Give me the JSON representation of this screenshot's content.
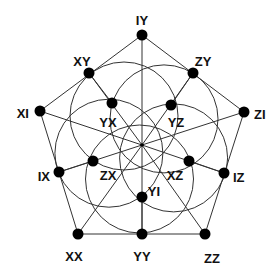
{
  "diagram": {
    "type": "pentagon-graph-with-circles",
    "center": {
      "x": 142,
      "y": 145
    },
    "colors": {
      "line": "#333333",
      "node": "#000000",
      "background": "#ffffff"
    },
    "nodes": [
      {
        "id": "IY",
        "label": "IY",
        "x": 142,
        "y": 35,
        "lx": 142,
        "ly": 22,
        "anchor": "middle"
      },
      {
        "id": "XY",
        "label": "XY",
        "x": 89,
        "y": 73,
        "lx": 82,
        "ly": 63,
        "anchor": "middle"
      },
      {
        "id": "ZY",
        "label": "ZY",
        "x": 193,
        "y": 73,
        "lx": 203,
        "ly": 63,
        "anchor": "middle"
      },
      {
        "id": "XI",
        "label": "XI",
        "x": 40,
        "y": 111,
        "lx": 29,
        "ly": 115,
        "anchor": "end"
      },
      {
        "id": "ZI",
        "label": "ZI",
        "x": 244,
        "y": 112,
        "lx": 254,
        "ly": 116,
        "anchor": "start"
      },
      {
        "id": "YX",
        "label": "YX",
        "x": 112,
        "y": 103,
        "lx": 108,
        "ly": 124,
        "anchor": "middle"
      },
      {
        "id": "YZ",
        "label": "YZ",
        "x": 171,
        "y": 105,
        "lx": 176,
        "ly": 124,
        "anchor": "middle"
      },
      {
        "id": "ZX",
        "label": "ZX",
        "x": 93,
        "y": 161,
        "lx": 108,
        "ly": 177,
        "anchor": "middle"
      },
      {
        "id": "XZ",
        "label": "XZ",
        "x": 189,
        "y": 161,
        "lx": 175,
        "ly": 177,
        "anchor": "middle"
      },
      {
        "id": "IX",
        "label": "IX",
        "x": 59,
        "y": 172,
        "lx": 50,
        "ly": 178,
        "anchor": "end"
      },
      {
        "id": "IZ",
        "label": "IZ",
        "x": 224,
        "y": 173,
        "lx": 233,
        "ly": 179,
        "anchor": "start"
      },
      {
        "id": "YI",
        "label": "YI",
        "x": 142,
        "y": 197,
        "lx": 154,
        "ly": 193,
        "anchor": "middle"
      },
      {
        "id": "XX",
        "label": "XX",
        "x": 78,
        "y": 234,
        "lx": 74,
        "ly": 258,
        "anchor": "middle"
      },
      {
        "id": "YY",
        "label": "YY",
        "x": 142,
        "y": 234,
        "lx": 142,
        "ly": 258,
        "anchor": "middle"
      },
      {
        "id": "ZZ",
        "label": "ZZ",
        "x": 205,
        "y": 234,
        "lx": 212,
        "ly": 260,
        "anchor": "middle"
      }
    ],
    "outer_pentagon": [
      "IY",
      "ZI",
      "ZZ",
      "XX",
      "XI"
    ],
    "spokes": [
      "IY",
      "XY",
      "ZY",
      "XI",
      "ZI",
      "IX",
      "IZ",
      "XX",
      "YY",
      "ZZ"
    ],
    "inner_edges": [
      [
        "XY",
        "YX"
      ],
      [
        "ZY",
        "YZ"
      ],
      [
        "IX",
        "ZX"
      ],
      [
        "IZ",
        "XZ"
      ],
      [
        "YY",
        "YI"
      ]
    ],
    "circles": {
      "count": 5,
      "offset": {
        "dx": -18,
        "dy": -29
      },
      "radius": 54
    }
  }
}
